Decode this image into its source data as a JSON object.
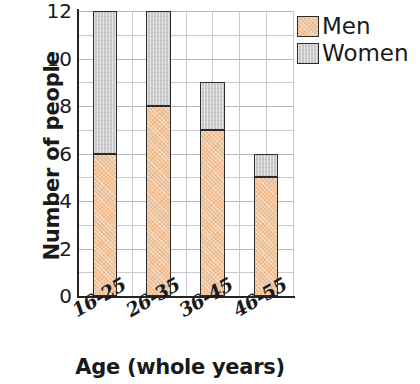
{
  "chart_data": {
    "type": "bar",
    "stacked": true,
    "title": "",
    "xlabel": "Age (whole years)",
    "ylabel": "Number of people",
    "categories": [
      "16-25",
      "26-35",
      "36-45",
      "46-55"
    ],
    "series": [
      {
        "name": "Men",
        "color": "#f2c49c",
        "values": [
          6,
          8,
          7,
          5
        ]
      },
      {
        "name": "Women",
        "color": "#c9c9c9",
        "values": [
          6,
          4,
          2,
          1
        ]
      }
    ],
    "totals": [
      12,
      12,
      9,
      6
    ],
    "ylim": [
      0,
      12
    ],
    "y_ticks": [
      0,
      2,
      4,
      6,
      8,
      10,
      12
    ],
    "y_tick_labels": [
      "0",
      "2",
      "4",
      "6",
      "8",
      "10",
      "12"
    ],
    "y_minor_step": 1,
    "grid": true,
    "legend_position": "top-right",
    "legend_entries": [
      "Men",
      "Women"
    ]
  },
  "axes": {
    "y_title": "Number of people",
    "x_title": "Age (whole years)",
    "y_tick_labels": [
      "12",
      "10",
      "8",
      "6",
      "4",
      "2",
      "0"
    ],
    "x_tick_labels": [
      "16-25",
      "26-35",
      "36-45",
      "46-55"
    ]
  },
  "legend": {
    "items": [
      {
        "label": "Men",
        "color": "#f2c49c"
      },
      {
        "label": "Women",
        "color": "#c9c9c9"
      }
    ]
  }
}
